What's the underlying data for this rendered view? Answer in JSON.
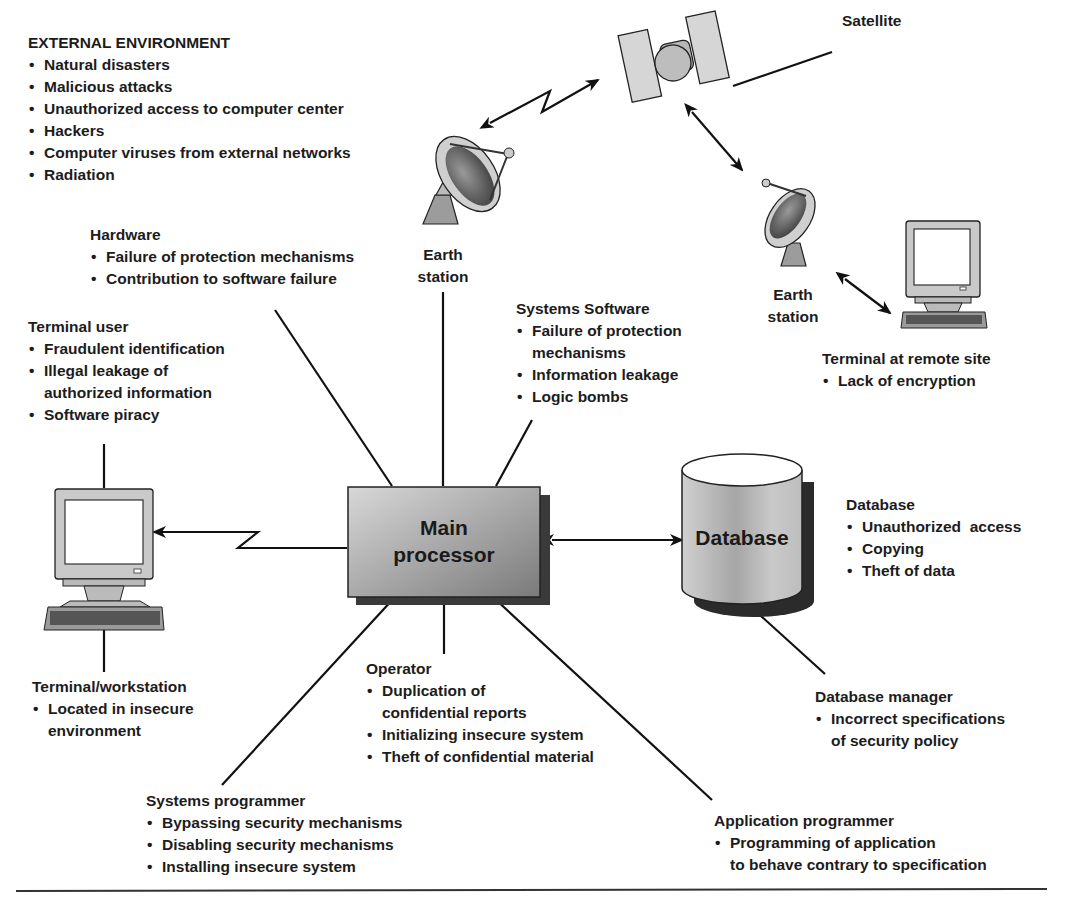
{
  "diagram": {
    "external_environment": {
      "title": "EXTERNAL ENVIRONMENT",
      "items": [
        "Natural disasters",
        "Malicious attacks",
        "Unauthorized access to computer center",
        "Hackers",
        "Computer viruses from external networks",
        "Radiation"
      ]
    },
    "hardware": {
      "title": "Hardware",
      "items": [
        "Failure of protection mechanisms",
        "Contribution to software failure"
      ]
    },
    "terminal_user": {
      "title": "Terminal user",
      "items": [
        "Fraudulent identification",
        "Illegal leakage of\nauthorized information",
        "Software piracy"
      ]
    },
    "systems_software": {
      "title": "Systems Software",
      "items": [
        "Failure of protection\nmechanisms",
        "Information leakage",
        "Logic bombs"
      ]
    },
    "satellite": {
      "label": "Satellite"
    },
    "earth_station_1": {
      "line1": "Earth",
      "line2": "station"
    },
    "earth_station_2": {
      "line1": "Earth",
      "line2": "station"
    },
    "remote_terminal": {
      "title": "Terminal at remote site",
      "items": [
        "Lack of encryption"
      ]
    },
    "main_processor": {
      "line1": "Main",
      "line2": "processor"
    },
    "database_node": {
      "label": "Database"
    },
    "database": {
      "title": "Database",
      "items": [
        "Unauthorized  access",
        "Copying",
        "Theft of data"
      ]
    },
    "terminal_workstation": {
      "title": "Terminal/workstation",
      "items": [
        "Located in insecure\nenvironment"
      ]
    },
    "operator": {
      "title": "Operator",
      "items": [
        "Duplication of\nconfidential reports",
        "Initializing insecure system",
        "Theft of confidential material"
      ]
    },
    "database_manager": {
      "title": "Database manager",
      "items": [
        "Incorrect specifications\nof security policy"
      ]
    },
    "systems_programmer": {
      "title": "Systems programmer",
      "items": [
        "Bypassing security mechanisms",
        "Disabling security mechanisms",
        "Installing insecure system"
      ]
    },
    "application_programmer": {
      "title": "Application programmer",
      "items": [
        "Programming of application\nto behave contrary to specification"
      ]
    }
  }
}
